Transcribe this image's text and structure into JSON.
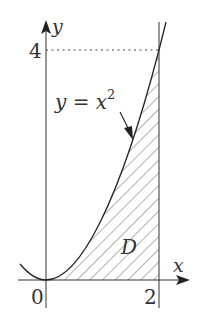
{
  "diagram": {
    "curve_label": "y = x",
    "curve_exponent": "2",
    "region_label": "D",
    "axis_x_label": "x",
    "axis_y_label": "y",
    "tick_origin": "0",
    "tick_x": "2",
    "tick_y": "4",
    "colors": {
      "ink": "#333333",
      "background": "#ffffff"
    }
  }
}
